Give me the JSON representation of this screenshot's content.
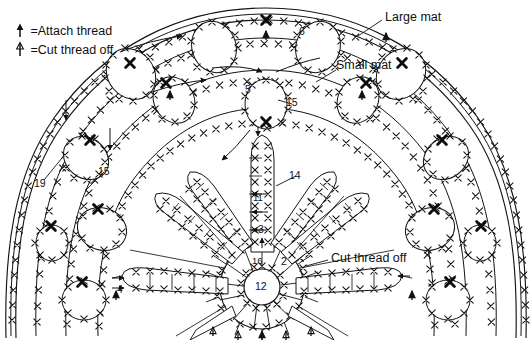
{
  "diagram": {
    "legend": [
      {
        "symbol": "attach-thread-symbol",
        "equals": "=",
        "label": "Attach thread"
      },
      {
        "symbol": "cut-thread-symbol",
        "equals": "=",
        "label": "Cut thread off"
      }
    ],
    "callouts": [
      {
        "id": "large-mat",
        "label": "Large mat",
        "x": 385,
        "y": 18
      },
      {
        "id": "small-mat",
        "label": "Small mat",
        "x": 340,
        "y": 65
      },
      {
        "id": "cut-thread-off",
        "label": "Cut thread off",
        "x": 330,
        "y": 259
      }
    ],
    "row_numbers": [
      {
        "id": "n19",
        "label": "19",
        "x": 34,
        "y": 183
      },
      {
        "id": "n15-left",
        "label": "15",
        "x": 98,
        "y": 172
      },
      {
        "id": "n15-center",
        "label": "15",
        "x": 286,
        "y": 103
      },
      {
        "id": "n5-top",
        "label": "5",
        "x": 245,
        "y": 90
      },
      {
        "id": "n6",
        "label": "6",
        "x": 299,
        "y": 32
      },
      {
        "id": "n14",
        "label": "14",
        "x": 289,
        "y": 176
      },
      {
        "id": "n11",
        "label": "11",
        "x": 253,
        "y": 199
      },
      {
        "id": "n3",
        "label": "3",
        "x": 258,
        "y": 230
      },
      {
        "id": "n16",
        "label": "16",
        "x": 256,
        "y": 262
      },
      {
        "id": "n2",
        "label": "2",
        "x": 281,
        "y": 262
      },
      {
        "id": "n12",
        "label": "12",
        "x": 258,
        "y": 287
      },
      {
        "id": "n4",
        "label": "4",
        "x": 117,
        "y": 290
      }
    ],
    "colors": {
      "ink": "#111111",
      "line": "#1a1a1a",
      "paper": "#ffffff"
    }
  }
}
